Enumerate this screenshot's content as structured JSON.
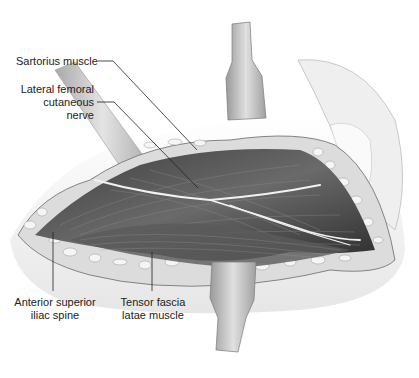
{
  "figure": {
    "labels": {
      "sartorius": "Sartorius muscle",
      "lfcn": "Lateral femoral\ncutaneous nerve",
      "asis": "Anterior superior\niliac spine",
      "tfl": "Tensor fascia\nlatae muscle"
    },
    "colors": {
      "muscle_dark": "#4a4a4a",
      "muscle_mid": "#6e6e6e",
      "fat_light": "#e8e8e8",
      "retractor": "#c8c8c8",
      "skin": "#f2f2f2",
      "nerve": "#f0f0f0",
      "leader": "#222222"
    }
  }
}
